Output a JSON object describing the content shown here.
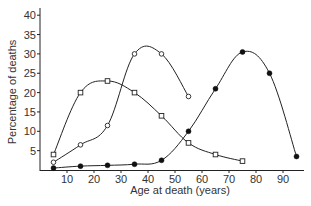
{
  "chart_data": {
    "type": "line",
    "title": "",
    "xlabel": "Age at death (years)",
    "ylabel": "Percentage of deaths",
    "xlim": [
      0,
      98
    ],
    "ylim": [
      0,
      42
    ],
    "x_ticks": [
      10,
      20,
      30,
      40,
      50,
      60,
      70,
      80,
      90
    ],
    "y_ticks": [
      5,
      10,
      15,
      20,
      25,
      30,
      35,
      40
    ],
    "grid": false,
    "legend": null,
    "series": [
      {
        "name": "open-square series",
        "marker": "open-square",
        "x": [
          5,
          15,
          25,
          35,
          45,
          55,
          65,
          75
        ],
        "values": [
          4,
          20,
          23,
          20,
          14,
          7,
          4,
          2.3
        ]
      },
      {
        "name": "open-circle series",
        "marker": "open-circle",
        "x": [
          5,
          15,
          25,
          35,
          45,
          55
        ],
        "values": [
          2,
          6.5,
          11.5,
          30,
          30,
          19
        ]
      },
      {
        "name": "filled-circle series",
        "marker": "filled-circle",
        "x": [
          5,
          15,
          25,
          35,
          45,
          55,
          65,
          75,
          85,
          95
        ],
        "values": [
          0.5,
          1,
          1.2,
          1.5,
          2.5,
          10,
          21,
          30.5,
          25,
          3.5
        ]
      }
    ]
  },
  "labels": {
    "xlabel": "Age at death (years)",
    "ylabel": "Percentage of deaths"
  }
}
